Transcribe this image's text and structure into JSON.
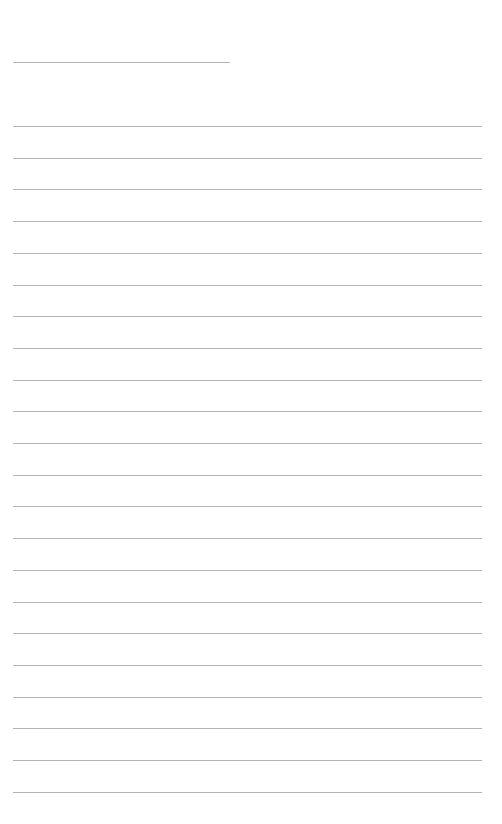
{
  "page": {
    "type": "blank lined writing paper",
    "background_color": "#ffffff",
    "line_color": "#b4b4b4"
  },
  "header_line": {
    "top": 62,
    "left": 13,
    "width": 217
  },
  "ruled_lines": {
    "count": 22,
    "first_top": 126,
    "spacing": 31.7,
    "left": 13,
    "width": 469
  }
}
